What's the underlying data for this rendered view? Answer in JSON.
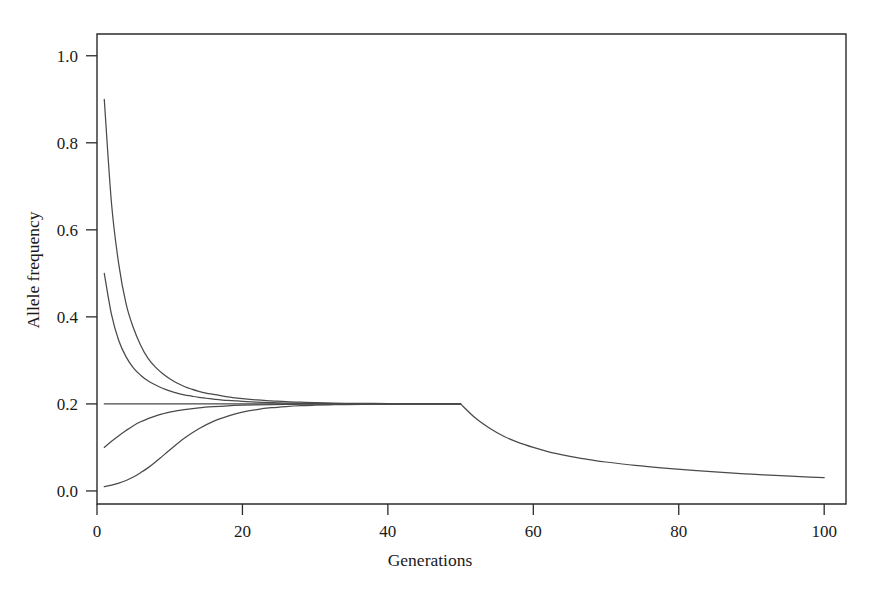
{
  "chart_data": {
    "type": "line",
    "title": "",
    "xlabel": "Generations",
    "ylabel": "Allele frequency",
    "xlim": [
      0,
      103
    ],
    "ylim": [
      -0.03,
      1.05
    ],
    "grid": false,
    "legend": false,
    "legend_position": "none",
    "line_color": "#4a4a4a",
    "axis_color": "#2b2b2b",
    "background_color": "#ffffff",
    "xticks": [
      0,
      20,
      40,
      60,
      80,
      100
    ],
    "xtick_labels": [
      "0",
      "20",
      "40",
      "60",
      "80",
      "100"
    ],
    "yticks": [
      0.0,
      0.2,
      0.4,
      0.6,
      0.8,
      1.0
    ],
    "ytick_labels": [
      "0.0",
      "0.2",
      "0.4",
      "0.6",
      "0.8",
      "1.0"
    ],
    "equilibrium": 0.2,
    "series": [
      {
        "name": "start-0.90",
        "start_value": 0.9,
        "x": [
          1,
          2,
          3,
          4,
          5,
          6,
          7,
          8,
          9,
          10,
          11,
          12,
          13,
          14,
          15,
          16,
          17,
          18,
          19,
          20,
          22,
          24,
          26,
          28,
          30,
          34,
          38,
          42,
          46,
          50
        ],
        "values": [
          0.9,
          0.66,
          0.52,
          0.43,
          0.375,
          0.335,
          0.305,
          0.285,
          0.27,
          0.258,
          0.248,
          0.24,
          0.234,
          0.229,
          0.225,
          0.222,
          0.219,
          0.216,
          0.214,
          0.212,
          0.209,
          0.207,
          0.205,
          0.204,
          0.203,
          0.2015,
          0.201,
          0.2005,
          0.2002,
          0.2
        ]
      },
      {
        "name": "start-0.50",
        "start_value": 0.5,
        "x": [
          1,
          2,
          3,
          4,
          5,
          6,
          7,
          8,
          9,
          10,
          11,
          12,
          13,
          14,
          15,
          16,
          17,
          18,
          19,
          20,
          22,
          24,
          26,
          28,
          30,
          34,
          38,
          42,
          46,
          50
        ],
        "values": [
          0.5,
          0.405,
          0.345,
          0.308,
          0.283,
          0.266,
          0.253,
          0.244,
          0.236,
          0.23,
          0.225,
          0.221,
          0.218,
          0.215,
          0.213,
          0.211,
          0.209,
          0.208,
          0.207,
          0.206,
          0.204,
          0.2028,
          0.202,
          0.2014,
          0.201,
          0.2005,
          0.2002,
          0.2001,
          0.2,
          0.2
        ]
      },
      {
        "name": "start-0.20",
        "start_value": 0.2,
        "x": [
          1,
          10,
          20,
          30,
          40,
          50
        ],
        "values": [
          0.2,
          0.2,
          0.2,
          0.2,
          0.2,
          0.2
        ]
      },
      {
        "name": "start-0.10",
        "start_value": 0.1,
        "x": [
          1,
          2,
          3,
          4,
          5,
          6,
          7,
          8,
          9,
          10,
          12,
          14,
          16,
          18,
          20,
          22,
          24,
          26,
          28,
          30,
          34,
          38,
          42,
          46,
          50
        ],
        "values": [
          0.1,
          0.114,
          0.127,
          0.139,
          0.15,
          0.159,
          0.166,
          0.172,
          0.177,
          0.181,
          0.187,
          0.191,
          0.1937,
          0.1957,
          0.197,
          0.1979,
          0.1985,
          0.199,
          0.1993,
          0.1995,
          0.1998,
          0.1999,
          0.2,
          0.2,
          0.2
        ]
      },
      {
        "name": "start-0.01",
        "start_value": 0.01,
        "x": [
          1,
          2,
          3,
          4,
          5,
          6,
          7,
          8,
          9,
          10,
          12,
          14,
          16,
          18,
          20,
          22,
          24,
          26,
          28,
          30,
          32,
          34,
          38,
          42,
          46,
          50
        ],
        "values": [
          0.01,
          0.0135,
          0.018,
          0.024,
          0.032,
          0.042,
          0.053,
          0.066,
          0.08,
          0.094,
          0.121,
          0.143,
          0.16,
          0.172,
          0.181,
          0.187,
          0.1912,
          0.1939,
          0.1958,
          0.197,
          0.1979,
          0.1986,
          0.1994,
          0.1997,
          0.1999,
          0.2
        ]
      },
      {
        "name": "decline-after-50",
        "start_value": 0.2,
        "x": [
          50,
          52,
          54,
          56,
          58,
          60,
          62,
          64,
          66,
          68,
          70,
          74,
          78,
          82,
          86,
          90,
          94,
          98,
          100
        ],
        "values": [
          0.2,
          0.168,
          0.144,
          0.125,
          0.111,
          0.1,
          0.0905,
          0.083,
          0.0765,
          0.0712,
          0.0665,
          0.0585,
          0.0522,
          0.047,
          0.0425,
          0.0385,
          0.035,
          0.0318,
          0.0305
        ]
      }
    ]
  }
}
